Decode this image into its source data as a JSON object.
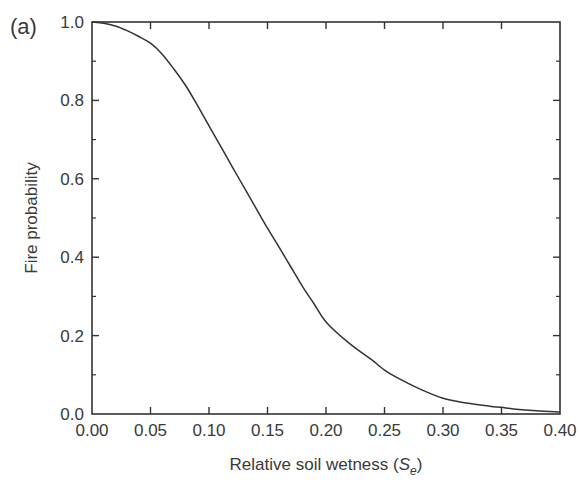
{
  "panel_label": "(a)",
  "chart_data": {
    "type": "line",
    "title": "",
    "xlabel": "Relative soil wetness (S_e)",
    "xlabel_main": "Relative soil wetness (",
    "xlabel_symbol": "S",
    "xlabel_subscript": "e",
    "xlabel_close": ")",
    "ylabel": "Fire probability",
    "xlim": [
      0.0,
      0.4
    ],
    "ylim": [
      0.0,
      1.0
    ],
    "x_ticks": [
      "0.00",
      "0.05",
      "0.10",
      "0.15",
      "0.20",
      "0.25",
      "0.30",
      "0.35",
      "0.40"
    ],
    "y_ticks": [
      "0.0",
      "0.2",
      "0.4",
      "0.6",
      "0.8",
      "1.0"
    ],
    "grid": false,
    "legend": null,
    "series": [
      {
        "name": "Fire probability",
        "color": "#333333",
        "x": [
          0.0,
          0.01,
          0.02,
          0.03,
          0.04,
          0.05,
          0.06,
          0.07,
          0.08,
          0.09,
          0.1,
          0.11,
          0.12,
          0.13,
          0.14,
          0.15,
          0.16,
          0.17,
          0.18,
          0.19,
          0.2,
          0.22,
          0.24,
          0.25,
          0.26,
          0.28,
          0.3,
          0.32,
          0.34,
          0.35,
          0.36,
          0.38,
          0.4
        ],
        "y": [
          1.0,
          0.997,
          0.99,
          0.978,
          0.963,
          0.946,
          0.918,
          0.88,
          0.838,
          0.788,
          0.735,
          0.683,
          0.63,
          0.578,
          0.526,
          0.474,
          0.425,
          0.375,
          0.325,
          0.28,
          0.235,
          0.18,
          0.136,
          0.112,
          0.094,
          0.064,
          0.04,
          0.028,
          0.02,
          0.017,
          0.013,
          0.008,
          0.005
        ]
      }
    ]
  }
}
